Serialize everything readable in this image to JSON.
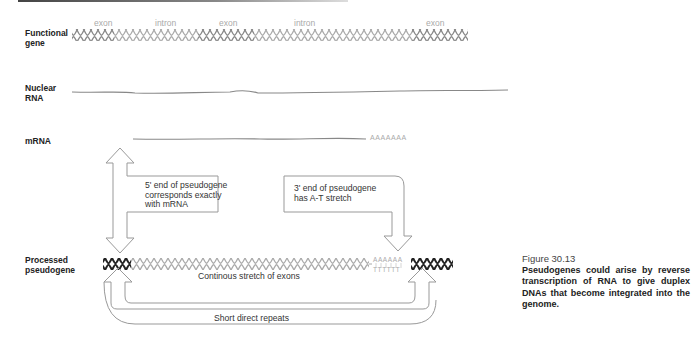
{
  "rows": {
    "functional_gene": {
      "label_line1": "Functional",
      "label_line2": "gene"
    },
    "nuclear_rna": {
      "label_line1": "Nuclear",
      "label_line2": "RNA"
    },
    "mrna": {
      "label_line1": "mRNA"
    },
    "processed_pseudogene": {
      "label_line1": "Processed",
      "label_line2": "pseudogene"
    }
  },
  "gene_segments": [
    {
      "label": "exon"
    },
    {
      "label": "intron"
    },
    {
      "label": "exon"
    },
    {
      "label": "intron"
    },
    {
      "label": "exon"
    }
  ],
  "poly_a_tail": "AAAAAAA",
  "at_stretch": {
    "top": "AAAAAA",
    "bottom": "TTTTTT"
  },
  "callouts": {
    "five_prime": {
      "line1": "5' end of pseudogene",
      "line2": "corresponds exactly",
      "line3": "with mRNA"
    },
    "three_prime": {
      "line1": "3' end of pseudogene",
      "line2": "has A-T stretch"
    }
  },
  "pseudogene_center_label": "Continous stretch of exons",
  "repeats_label": "Short direct repeats",
  "caption": {
    "title": "Figure 30.13",
    "body": "Pseudogenes could arise by reverse transcription of RNA to give duplex DNAs that become integrated into the genome."
  },
  "colors": {
    "dark_helix": "#222222",
    "light_helix": "#999999",
    "line_gray": "#888888",
    "arrow_outline": "#999999"
  }
}
